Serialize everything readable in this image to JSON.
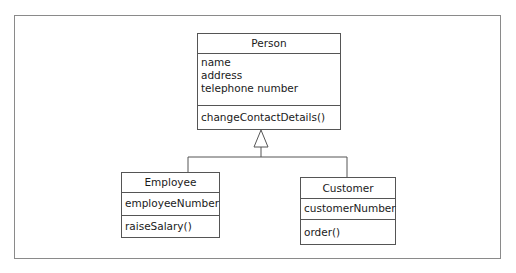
{
  "diagram": {
    "type": "UML class diagram (generalization)",
    "classes": {
      "person": {
        "name": "Person",
        "attributes": [
          "name",
          "address",
          "telephone number"
        ],
        "operations": [
          "changeContactDetails()"
        ]
      },
      "employee": {
        "name": "Employee",
        "attributes": [
          "employeeNumber"
        ],
        "operations": [
          "raiseSalary()"
        ]
      },
      "customer": {
        "name": "Customer",
        "attributes": [
          "customerNumber"
        ],
        "operations": [
          "order()"
        ]
      }
    },
    "relationships": [
      {
        "type": "generalization",
        "from": "Employee",
        "to": "Person"
      },
      {
        "type": "generalization",
        "from": "Customer",
        "to": "Person"
      }
    ],
    "colors": {
      "line": "#555555",
      "frame": "#8a8a8a",
      "background": "#ffffff"
    }
  }
}
